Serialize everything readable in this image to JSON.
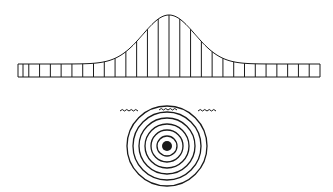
{
  "diagram": {
    "stroke_color": "#1a1a1a",
    "background": "#ffffff",
    "wave_pulse": {
      "strip": {
        "x_start": 18,
        "x_end": 320,
        "y_top": 64,
        "y_bottom": 77
      },
      "segment_count": 28,
      "peak": {
        "x": 169,
        "y": 15
      },
      "shape": "bell-curve"
    },
    "ripple_rings": {
      "center": {
        "x": 167,
        "y": 146
      },
      "ring_radii": [
        40,
        34,
        28,
        22,
        16,
        10
      ],
      "core_radius": 5,
      "surface_waves_y": 111
    }
  }
}
